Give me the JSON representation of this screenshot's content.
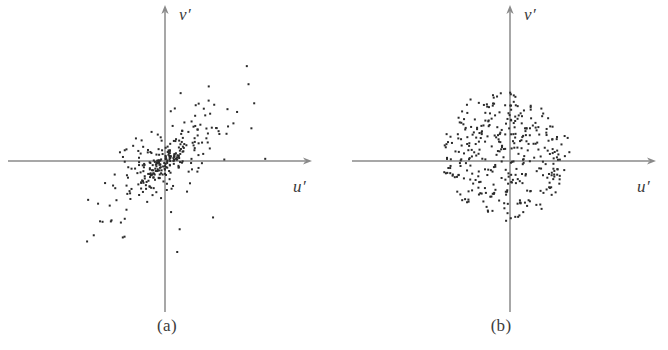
{
  "figure": {
    "width": 668,
    "height": 350,
    "background_color": "#ffffff",
    "axis_color": "#8a8a8a",
    "point_color": "#2b2b2b",
    "label_color": "#3a3a3a"
  },
  "panels": [
    {
      "id": "a",
      "caption": "(a)",
      "x_axis_label": "u′",
      "y_axis_label": "v′",
      "origin": {
        "x": 165,
        "y": 161
      },
      "x_axis": {
        "x_start": 8,
        "x_end": 312
      },
      "y_axis": {
        "y_start": 5,
        "y_end": 312
      },
      "caption_y": 316
    },
    {
      "id": "b",
      "caption": "(b)",
      "x_axis_label": "u′",
      "y_axis_label": "v′",
      "origin": {
        "x": 176,
        "y": 161
      },
      "x_axis": {
        "x_start": 18,
        "x_end": 322
      },
      "y_axis": {
        "y_start": 5,
        "y_end": 312
      },
      "caption_y": 316
    }
  ],
  "chart_data": [
    {
      "type": "scatter",
      "title": "(a)",
      "xlabel": "u′",
      "ylabel": "v′",
      "grid": false,
      "legend": null,
      "axes_style": "arrowed-cartesian-cross",
      "n_points": 300,
      "description": "Strongly positively correlated bivariate cloud, elongated along the +45 degree diagonal, dense concentrated core near the origin with sparse outlying tail toward upper-right and lower-left.",
      "distribution": {
        "kind": "bivariate-normal-mixture",
        "seed": 20147,
        "components": [
          {
            "weight": 0.42,
            "mean_x": 2,
            "mean_y": -1,
            "sigma_major": 16,
            "sigma_minor": 6,
            "angle_deg": 40
          },
          {
            "weight": 0.38,
            "mean_x": 4,
            "mean_y": 4,
            "sigma_major": 42,
            "sigma_minor": 15,
            "angle_deg": 40
          },
          {
            "weight": 0.2,
            "mean_x": 6,
            "mean_y": 6,
            "sigma_major": 66,
            "sigma_minor": 24,
            "angle_deg": 41
          }
        ],
        "correlation": 0.84,
        "x_range": [
          -95,
          105
        ],
        "y_range": [
          -95,
          95
        ]
      },
      "point_size_px": 2,
      "point_color": "#2b2b2b"
    },
    {
      "type": "scatter",
      "title": "(b)",
      "xlabel": "u′",
      "ylabel": "v′",
      "grid": false,
      "legend": null,
      "axes_style": "arrowed-cartesian-cross",
      "n_points": 360,
      "description": "Uncorrelated isotropic circular cloud of roughly uniform density, radius about 62 pixels, centred slightly left of and below the origin.",
      "distribution": {
        "kind": "isotropic-disc",
        "seed": 77231,
        "center_x": -6,
        "center_y": 4,
        "radius": 64,
        "density": "near-uniform-with-soft-edge",
        "correlation": 0.0,
        "x_range": [
          -75,
          70
        ],
        "y_range": [
          -70,
          72
        ]
      },
      "point_size_px": 2,
      "point_color": "#2b2b2b"
    }
  ]
}
